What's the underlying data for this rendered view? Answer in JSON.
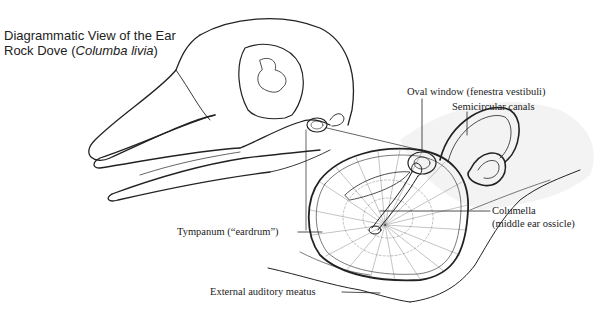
{
  "title": {
    "line1": "Diagrammatic View of the Ear",
    "line2_prefix": "Rock Dove (",
    "line2_italic": "Columba livia",
    "line2_suffix": ")"
  },
  "labels": {
    "oval_window": "Oval window (fenestra vestibuli)",
    "semicircular_canals": "Semicircular canals",
    "columella_1": "Columella",
    "columella_2": "(middle ear ossicle)",
    "tympanum": "Tympanum (“eardrum”)",
    "external_meatus": "External auditory meatus"
  },
  "colors": {
    "ink": "#222222",
    "background": "#ffffff"
  }
}
